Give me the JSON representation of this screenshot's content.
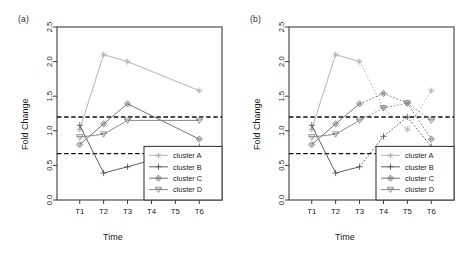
{
  "figure": {
    "panels": [
      {
        "label": "(a)",
        "xlabel": "Time",
        "ylabel": "Fold Change"
      },
      {
        "label": "(b)",
        "xlabel": "Time",
        "ylabel": "Fold Change"
      }
    ],
    "legend": {
      "items": [
        {
          "label": "cluster A",
          "marker": "asterisk-marker",
          "color": "#b0b0b0"
        },
        {
          "label": "cluster B",
          "marker": "plus-marker",
          "color": "#555555"
        },
        {
          "label": "cluster C",
          "marker": "diamond-marker",
          "color": "#6e6e6e"
        },
        {
          "label": "cluster D",
          "marker": "triangle-down-marker",
          "color": "#858585"
        }
      ]
    }
  },
  "chart_data": [
    {
      "type": "line",
      "panel": "(a)",
      "title": "",
      "xlabel": "Time",
      "ylabel": "Fold Change",
      "categories": [
        "T1",
        "T2",
        "T3",
        "T4",
        "T5",
        "T6"
      ],
      "ylim": [
        0.0,
        2.5
      ],
      "yticks": [
        0.0,
        0.5,
        1.0,
        1.5,
        2.0,
        2.5
      ],
      "grid": false,
      "legend_position": "bottom-right",
      "reference_lines": [
        1.2,
        0.67
      ],
      "series": [
        {
          "name": "cluster A",
          "color": "#b0b0b0",
          "marker": "asterisk",
          "linestyle": "solid",
          "x": [
            "T1",
            "T2",
            "T3",
            "T6"
          ],
          "values": [
            1.02,
            2.1,
            2.0,
            1.58
          ]
        },
        {
          "name": "cluster B",
          "color": "#555555",
          "marker": "plus",
          "linestyle": "solid",
          "x": [
            "T1",
            "T2",
            "T3",
            "T6"
          ],
          "values": [
            1.08,
            0.39,
            0.48,
            0.77
          ]
        },
        {
          "name": "cluster C",
          "color": "#6e6e6e",
          "marker": "diamond",
          "linestyle": "solid",
          "x": [
            "T1",
            "T2",
            "T3",
            "T6"
          ],
          "values": [
            0.8,
            1.1,
            1.39,
            0.88
          ]
        },
        {
          "name": "cluster D",
          "color": "#858585",
          "marker": "triangle-down",
          "linestyle": "solid",
          "x": [
            "T1",
            "T2",
            "T3",
            "T6"
          ],
          "values": [
            0.91,
            0.95,
            1.15,
            1.15
          ]
        }
      ]
    },
    {
      "type": "line",
      "panel": "(b)",
      "title": "",
      "xlabel": "Time",
      "ylabel": "Fold Change",
      "categories": [
        "T1",
        "T2",
        "T3",
        "T4",
        "T5",
        "T6"
      ],
      "ylim": [
        0.0,
        2.5
      ],
      "yticks": [
        0.0,
        0.5,
        1.0,
        1.5,
        2.0,
        2.5
      ],
      "grid": false,
      "legend_position": "bottom-right",
      "reference_lines": [
        1.2,
        0.67
      ],
      "series": [
        {
          "name": "cluster A",
          "color": "#b0b0b0",
          "marker": "asterisk",
          "linestyle": "solid-then-dotted",
          "solid_until": "T3",
          "x": [
            "T1",
            "T2",
            "T3",
            "T4",
            "T5",
            "T6"
          ],
          "values": [
            1.02,
            2.1,
            2.0,
            1.33,
            1.02,
            1.58
          ]
        },
        {
          "name": "cluster B",
          "color": "#555555",
          "marker": "plus",
          "linestyle": "solid-then-dotted",
          "solid_until": "T3",
          "x": [
            "T1",
            "T2",
            "T3",
            "T4",
            "T5",
            "T6"
          ],
          "values": [
            1.08,
            0.39,
            0.48,
            0.92,
            1.2,
            0.77
          ]
        },
        {
          "name": "cluster C",
          "color": "#6e6e6e",
          "marker": "diamond",
          "linestyle": "solid-then-dotted",
          "solid_until": "T3",
          "x": [
            "T1",
            "T2",
            "T3",
            "T4",
            "T5",
            "T6"
          ],
          "values": [
            0.8,
            1.1,
            1.39,
            1.54,
            1.4,
            0.88
          ]
        },
        {
          "name": "cluster D",
          "color": "#858585",
          "marker": "triangle-down",
          "linestyle": "solid-then-dotted",
          "solid_until": "T3",
          "x": [
            "T1",
            "T2",
            "T3",
            "T4",
            "T5",
            "T6"
          ],
          "values": [
            0.91,
            0.95,
            1.15,
            1.33,
            1.4,
            1.15
          ]
        }
      ]
    }
  ]
}
